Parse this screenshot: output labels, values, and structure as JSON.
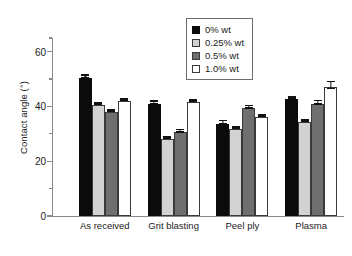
{
  "chart_data": {
    "type": "bar",
    "title": "",
    "xlabel": "",
    "ylabel": "Contact angle (°)",
    "categories": [
      "As received",
      "Grit blasting",
      "Peel ply",
      "Plasma"
    ],
    "series": [
      {
        "name": "0% wt",
        "color": "#0b0b0b",
        "values": [
          50.5,
          41.0,
          33.6,
          42.8
        ],
        "errors": [
          0.4,
          0.4,
          0.6,
          0.3
        ]
      },
      {
        "name": "0.25% wt",
        "color": "#d2d2d2",
        "values": [
          40.4,
          28.0,
          31.8,
          34.4
        ],
        "errors": [
          0.3,
          0.3,
          0.3,
          0.3
        ]
      },
      {
        "name": "0.5% wt",
        "color": "#6f6f6f",
        "values": [
          38.1,
          30.6,
          39.3,
          41.0
        ],
        "errors": [
          0.3,
          0.5,
          0.5,
          0.7
        ]
      },
      {
        "name": "1.0% wt",
        "color": "#ffffff",
        "values": [
          42.1,
          41.7,
          36.2,
          47.2
        ],
        "errors": [
          0.3,
          0.3,
          0.3,
          1.2
        ]
      }
    ],
    "ylim": [
      0,
      65
    ],
    "yticks": [
      0,
      20,
      40,
      60
    ],
    "ytick_labels": [
      "0",
      "20",
      "40",
      "60"
    ],
    "yminor_ticks": [
      10,
      30,
      50,
      65
    ],
    "grid": false,
    "legend_position": "top-right",
    "legend_entries": [
      "0% wt",
      "0.25% wt",
      "0.5% wt",
      "1.0% wt"
    ]
  }
}
